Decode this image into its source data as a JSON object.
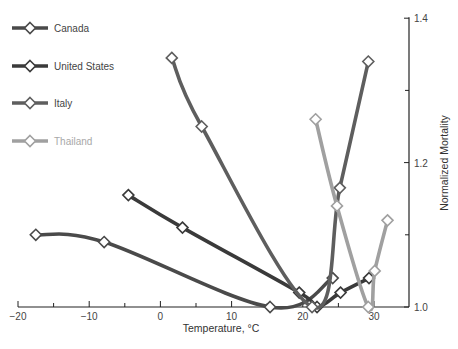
{
  "chart_data": {
    "type": "line",
    "title": "",
    "xlabel": "Temperature, °C",
    "ylabel": "Normalized Mortality",
    "xlim": [
      -20,
      35
    ],
    "ylim": [
      1.0,
      1.4
    ],
    "x_ticks": [
      -20,
      -10,
      0,
      10,
      20,
      30
    ],
    "x_minor_ticks": [
      -15,
      -5,
      5,
      15,
      25
    ],
    "y_ticks": [
      1.0,
      1.2,
      1.4
    ],
    "y_tick_labels": [
      "1.0",
      "1.2",
      "1.4"
    ],
    "y_minor_ticks": [
      1.1,
      1.3
    ],
    "y_axis_position": "right",
    "grid": false,
    "legend_position": "top-left",
    "series": [
      {
        "name": "Canada",
        "color": "#4a4a4a",
        "x": [
          -17.5,
          -7.9,
          15.4,
          24.2
        ],
        "y": [
          1.1,
          1.09,
          1.0,
          1.04
        ]
      },
      {
        "name": "United States",
        "color": "#3a3a3a",
        "x": [
          -4.5,
          3.1,
          19.5,
          22.0,
          25.3,
          29.3
        ],
        "y": [
          1.155,
          1.11,
          1.02,
          1.0,
          1.02,
          1.04
        ]
      },
      {
        "name": "Italy",
        "color": "#5e5e5e",
        "x": [
          1.6,
          5.8,
          21.3,
          25.2,
          29.2
        ],
        "y": [
          1.345,
          1.25,
          1.0,
          1.165,
          1.34
        ]
      },
      {
        "name": "Thailand",
        "color": "#a0a0a0",
        "x": [
          21.8,
          24.8,
          29.2,
          30.1,
          31.9
        ],
        "y": [
          1.26,
          1.14,
          1.0,
          1.05,
          1.12
        ]
      }
    ]
  }
}
